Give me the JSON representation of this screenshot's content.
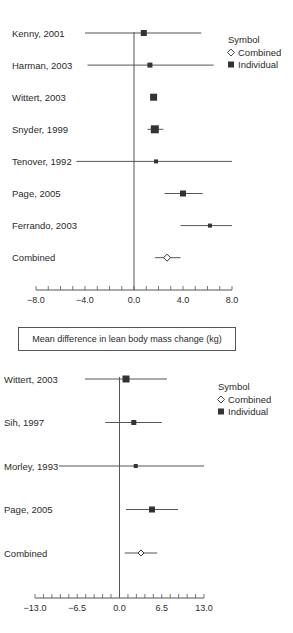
{
  "chart_data": [
    {
      "type": "forest",
      "title": "",
      "xlabel": "Mean difference in lean body mass change (kg)",
      "xlim": [
        -8.0,
        8.0
      ],
      "xticks": [
        "-8.0",
        "-4.0",
        "0.0",
        "4.0",
        "8.0"
      ],
      "minor_tick_step": 1.0,
      "reference_line": 0.0,
      "legend": {
        "title": "Symbol",
        "entries": [
          "Combined",
          "Individual"
        ],
        "position": "top-right"
      },
      "studies": [
        {
          "label": "Kenny, 2001",
          "estimate": 0.8,
          "ci_low": -4.0,
          "ci_high": 5.5,
          "type": "Individual",
          "size": 6
        },
        {
          "label": "Harman, 2003",
          "estimate": 1.3,
          "ci_low": -3.8,
          "ci_high": 6.5,
          "type": "Individual",
          "size": 5
        },
        {
          "label": "Wittert, 2003",
          "estimate": 1.6,
          "ci_low": 1.4,
          "ci_high": 1.8,
          "type": "Individual",
          "size": 7
        },
        {
          "label": "Snyder, 1999",
          "estimate": 1.7,
          "ci_low": 1.1,
          "ci_high": 2.4,
          "type": "Individual",
          "size": 8
        },
        {
          "label": "Tenover, 1992",
          "estimate": 1.8,
          "ci_low": -4.7,
          "ci_high": 8.0,
          "type": "Individual",
          "size": 4
        },
        {
          "label": "Page, 2005",
          "estimate": 4.0,
          "ci_low": 2.5,
          "ci_high": 5.6,
          "type": "Individual",
          "size": 6
        },
        {
          "label": "Ferrando, 2003",
          "estimate": 6.2,
          "ci_low": 3.8,
          "ci_high": 8.0,
          "type": "Individual",
          "size": 4
        },
        {
          "label": "Combined",
          "estimate": 2.7,
          "ci_low": 1.7,
          "ci_high": 3.8,
          "type": "Combined",
          "size": 7
        }
      ]
    },
    {
      "type": "forest",
      "title": "",
      "xlabel": "",
      "xlim": [
        -13.0,
        13.0
      ],
      "xticks": [
        "-13.0",
        "-6.5",
        "0.0",
        "6.5",
        "13.0"
      ],
      "minor_tick_step": 1.3,
      "reference_line": 0.0,
      "legend": {
        "title": "Symbol",
        "entries": [
          "Combined",
          "Individual"
        ],
        "position": "top-right"
      },
      "studies": [
        {
          "label": "Wittert, 2003",
          "estimate": 1.0,
          "ci_low": -5.3,
          "ci_high": 7.3,
          "type": "Individual",
          "size": 7
        },
        {
          "label": "Sih, 1997",
          "estimate": 2.2,
          "ci_low": -2.2,
          "ci_high": 6.5,
          "type": "Individual",
          "size": 5
        },
        {
          "label": "Morley, 1993",
          "estimate": 2.5,
          "ci_low": -9.3,
          "ci_high": 13.0,
          "type": "Individual",
          "size": 4
        },
        {
          "label": "Page, 2005",
          "estimate": 5.0,
          "ci_low": 1.0,
          "ci_high": 9.0,
          "type": "Individual",
          "size": 6
        },
        {
          "label": "Combined",
          "estimate": 3.3,
          "ci_low": 0.8,
          "ci_high": 5.8,
          "type": "Combined",
          "size": 6
        }
      ]
    }
  ],
  "colors": {
    "ink": "#2a2a2a",
    "marker": "#333333",
    "line": "#555555",
    "background": "#ffffff"
  },
  "xlabel_box": {
    "text": "Mean difference in lean body mass change (kg)"
  }
}
